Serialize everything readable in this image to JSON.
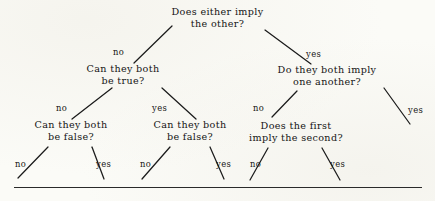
{
  "page": {
    "kind": "scanned-book-figure",
    "background_color": "#fbfbf7",
    "ink_color": "#141414"
  },
  "diagram": {
    "type": "decision-tree",
    "title": "",
    "nodes": [
      {
        "id": "root",
        "line1": "Does either imply",
        "line2": "the other?",
        "level": 0
      },
      {
        "id": "n-no",
        "line1": "Can they both",
        "line2": "be true?",
        "level": 1
      },
      {
        "id": "n-yes",
        "line1": "Do they both imply",
        "line2": "one another?",
        "level": 1
      },
      {
        "id": "n-no-no",
        "line1": "Can they both",
        "line2": "be false?",
        "level": 2
      },
      {
        "id": "n-no-yes",
        "line1": "Can they both",
        "line2": "be false?",
        "level": 2
      },
      {
        "id": "n-yes-no",
        "line1": "Does the first",
        "line2": "imply the second?",
        "level": 2
      }
    ],
    "edge_labels": [
      {
        "id": "e-root-no",
        "text": "no",
        "from": "root",
        "to": "n-no"
      },
      {
        "id": "e-root-yes",
        "text": "yes",
        "from": "root",
        "to": "n-yes"
      },
      {
        "id": "e-no-no",
        "text": "no",
        "from": "n-no",
        "to": "n-no-no"
      },
      {
        "id": "e-no-yes",
        "text": "yes",
        "from": "n-no",
        "to": "n-no-yes"
      },
      {
        "id": "e-yes-no",
        "text": "no",
        "from": "n-yes",
        "to": "n-yes-no"
      },
      {
        "id": "e-yes-yes",
        "text": "yes",
        "from": "n-yes",
        "to": "leaf-6"
      },
      {
        "id": "e-nono-no",
        "text": "no",
        "from": "n-no-no",
        "to": "leaf-1"
      },
      {
        "id": "e-nono-yes",
        "text": "yes",
        "from": "n-no-no",
        "to": "leaf-2"
      },
      {
        "id": "e-noyes-no",
        "text": "no",
        "from": "n-no-yes",
        "to": "leaf-3"
      },
      {
        "id": "e-noyes-yes",
        "text": "yes",
        "from": "n-no-yes",
        "to": "leaf-4"
      },
      {
        "id": "e-yesno-no",
        "text": "no",
        "from": "n-yes-no",
        "to": "leaf-5"
      },
      {
        "id": "e-yesno-yes",
        "text": "yes",
        "from": "n-yes-no",
        "to": "leaf-7"
      }
    ]
  }
}
